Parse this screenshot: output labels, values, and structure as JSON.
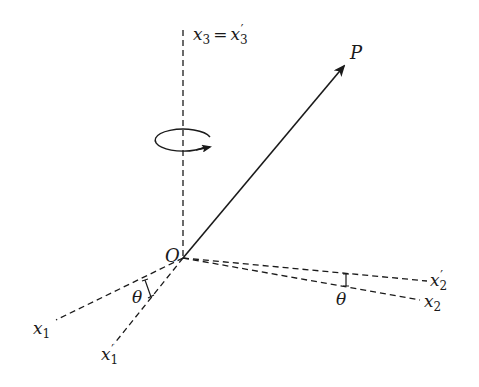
{
  "diagram": {
    "origin_label": "O",
    "vector_label": "P",
    "axis_x3_label": {
      "var": "x",
      "sub": "3",
      "eq": "=",
      "var2": "x",
      "sub2": "3",
      "prime": "′"
    },
    "axis_x1_label": {
      "var": "x",
      "sub": "1"
    },
    "axis_x1p_label": {
      "var": "x",
      "sub": "1",
      "prime": "′"
    },
    "axis_x2_label": {
      "var": "x",
      "sub": "2"
    },
    "axis_x2p_label": {
      "var": "x",
      "sub": "2",
      "prime": "′"
    },
    "angle_label_1": "θ",
    "angle_label_2": "θ",
    "colors": {
      "line": "#1a1a1a",
      "background": "#ffffff"
    }
  }
}
